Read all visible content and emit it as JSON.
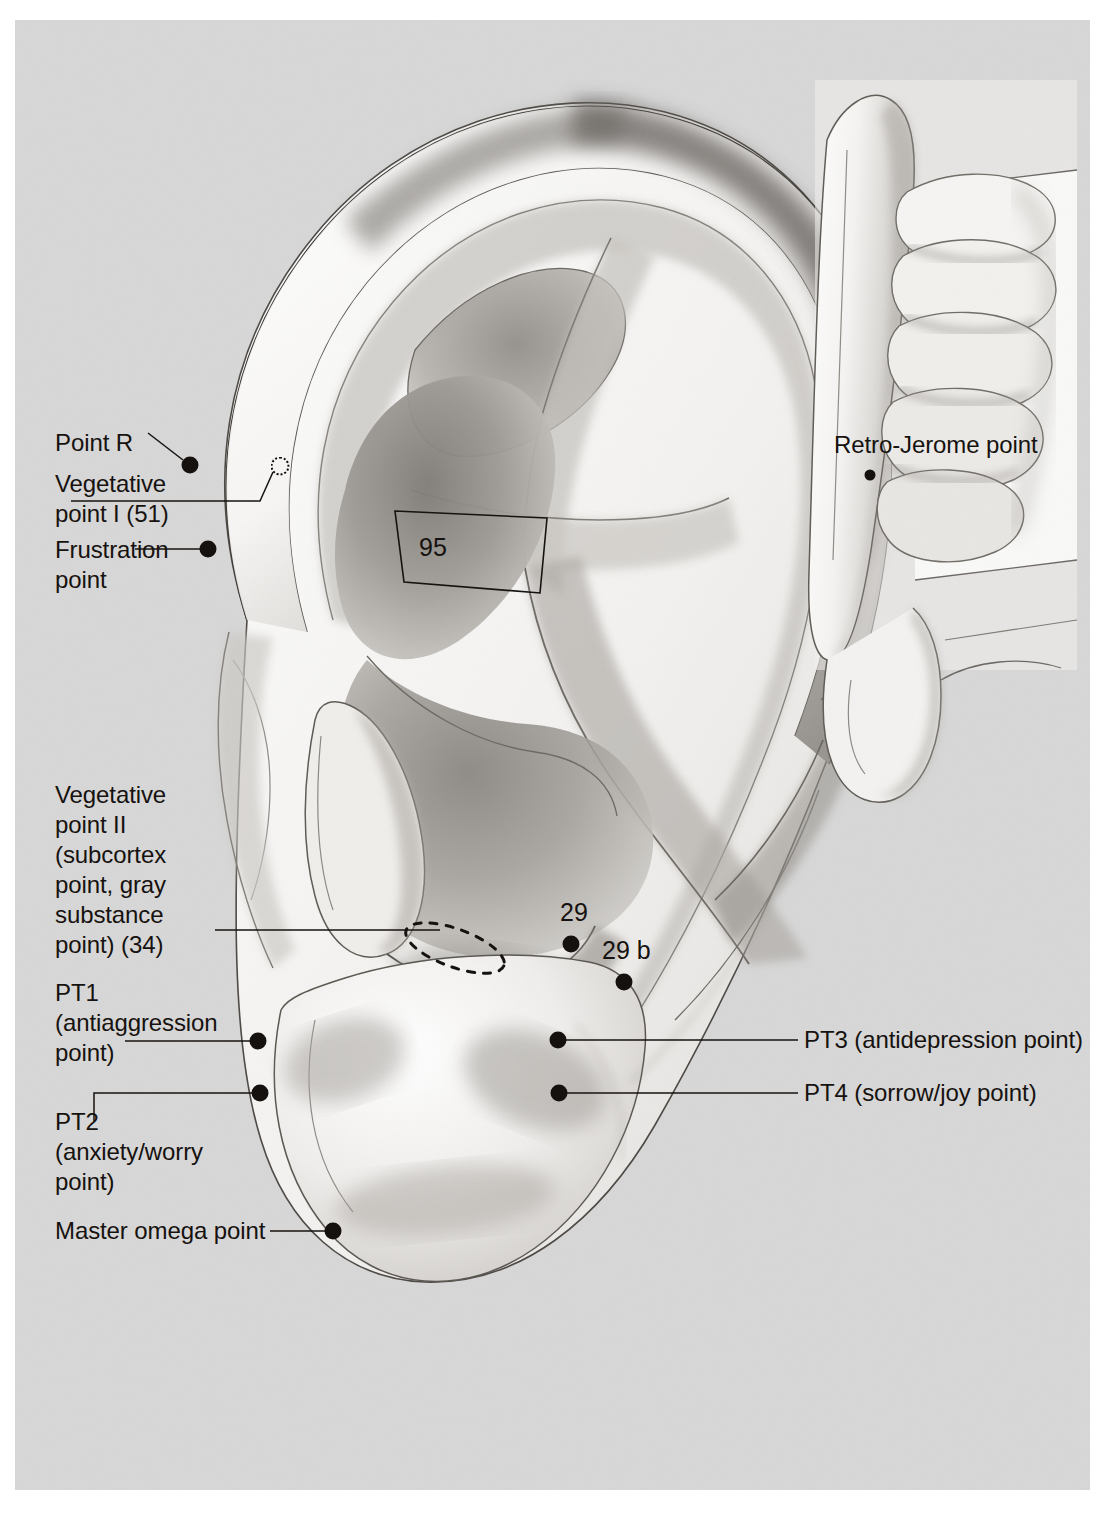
{
  "plate": {
    "title": "Ear acupuncture points — lateral auricle and retroauricular view",
    "background_color": "#d7d7d7",
    "ink_color": "#16120f",
    "page_color": "#ffffff"
  },
  "labels": {
    "point_r": "Point R",
    "vegetative_i": "Vegetative\npoint I (51)",
    "frustration": "Frustration\npoint",
    "vegetative_ii": "Vegetative\npoint II\n(subcortex\npoint, gray\nsubstance\npoint) (34)",
    "pt1": "PT1\n(antiaggression\npoint)",
    "pt2": "PT2\n(anxiety/worry\npoint)",
    "master_omega": "Master omega point",
    "pt3": "PT3 (antidepression point)",
    "pt4": "PT4 (sorrow/joy point)",
    "retro_jerome": "Retro-Jerome point",
    "zone_95": "95",
    "point_29": "29",
    "point_29b": "29 b"
  },
  "markers": [
    {
      "name": "point-r-marker",
      "label": "Point R",
      "kind": "filled",
      "x": 175,
      "y": 445
    },
    {
      "name": "vegetative-point-i-marker",
      "label": "Vegetative point I (51)",
      "kind": "dotted-circle",
      "x": 265,
      "y": 446
    },
    {
      "name": "frustration-point-marker",
      "label": "Frustration point",
      "kind": "filled",
      "x": 193,
      "y": 529
    },
    {
      "name": "pt1-marker",
      "label": "PT1 (antiaggression point)",
      "kind": "filled",
      "x": 243,
      "y": 1021
    },
    {
      "name": "pt2-marker",
      "label": "PT2 (anxiety/worry point)",
      "kind": "filled",
      "x": 245,
      "y": 1073
    },
    {
      "name": "master-omega-point-marker",
      "label": "Master omega point",
      "kind": "filled",
      "x": 318,
      "y": 1211
    },
    {
      "name": "point-29-marker",
      "label": "29",
      "kind": "filled",
      "x": 556,
      "y": 924
    },
    {
      "name": "point-29b-marker",
      "label": "29 b",
      "kind": "filled",
      "x": 609,
      "y": 962
    },
    {
      "name": "pt3-marker",
      "label": "PT3 (antidepression point)",
      "kind": "filled",
      "x": 543,
      "y": 1020
    },
    {
      "name": "pt4-marker",
      "label": "PT4 (sorrow/joy point)",
      "kind": "filled",
      "x": 544,
      "y": 1073
    },
    {
      "name": "retro-jerome-point-marker",
      "label": "Retro-Jerome point",
      "kind": "filled-small",
      "x": 855,
      "y": 455
    }
  ],
  "annotations": {
    "zone_95_shape": "quadrilateral outline over the antihelix inferior crus",
    "point_34_shape": "dashed tilted ellipse over the antitragus"
  }
}
